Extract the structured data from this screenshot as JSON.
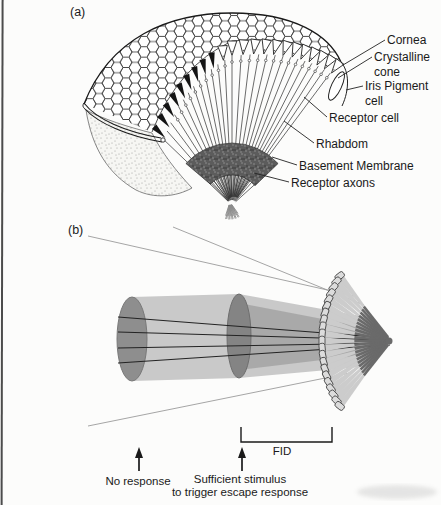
{
  "panel_a": {
    "tag": "(a)",
    "labels": {
      "cornea": "Cornea",
      "crystalline_cone": "Crystalline cone",
      "iris_pigment_cell": "Iris Pigment cell",
      "receptor_cell": "Receptor cell",
      "rhabdom": "Rhabdom",
      "basement_membrane": "Basement Membrane",
      "receptor_axons": "Receptor axons"
    }
  },
  "panel_b": {
    "tag": "(b)",
    "fid_label": "FID",
    "no_response": "No response",
    "sufficient_stimulus_line1": "Sufficient stimulus",
    "sufficient_stimulus_line2": "to trigger escape response"
  },
  "colors": {
    "ink": "#1a1a1a",
    "line_gray": "#9b9b9b",
    "disc_near_fill": "#8e8e8e",
    "disc_far_fill": "#848484",
    "beam_light": "#c9c9c9",
    "beam_medium": "#a8a8a8",
    "facet_fill": "#dcdcdc",
    "cone_fill": "#cccccc",
    "rod_gray": "#6a6a6a",
    "membrane_dark": "#5c5c5c",
    "paper": "#fcfcfb"
  }
}
